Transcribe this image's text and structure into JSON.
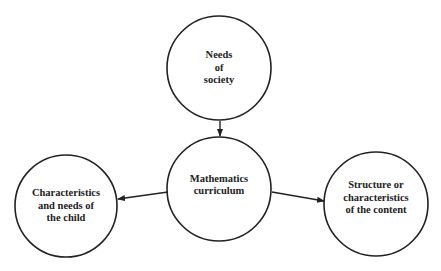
{
  "diagram": {
    "type": "concept-map",
    "nodes": [
      {
        "id": "society",
        "label_lines": [
          "Needs",
          "of",
          "society"
        ],
        "cx": 219,
        "cy": 68,
        "r": 52
      },
      {
        "id": "curriculum",
        "label_lines": [
          "Mathematics",
          "curriculum"
        ],
        "cx": 219,
        "cy": 189,
        "r": 52
      },
      {
        "id": "child",
        "label_lines": [
          "Characteristics",
          "and needs of",
          "the child"
        ],
        "cx": 66,
        "cy": 206,
        "r": 51
      },
      {
        "id": "content",
        "label_lines": [
          "Structure or",
          "characteristics",
          "of the content"
        ],
        "cx": 376,
        "cy": 204,
        "r": 52
      }
    ],
    "edges": [
      {
        "from": "society",
        "to": "curriculum",
        "x1": 220,
        "y1": 121,
        "x2": 220,
        "y2": 136
      },
      {
        "from": "curriculum",
        "to": "child",
        "x1": 168,
        "y1": 192,
        "x2": 118,
        "y2": 199
      },
      {
        "from": "curriculum",
        "to": "content",
        "x1": 272,
        "y1": 192,
        "x2": 324,
        "y2": 201
      }
    ],
    "colors": {
      "stroke": "#222222",
      "background": "#ffffff",
      "text": "#222222"
    }
  }
}
